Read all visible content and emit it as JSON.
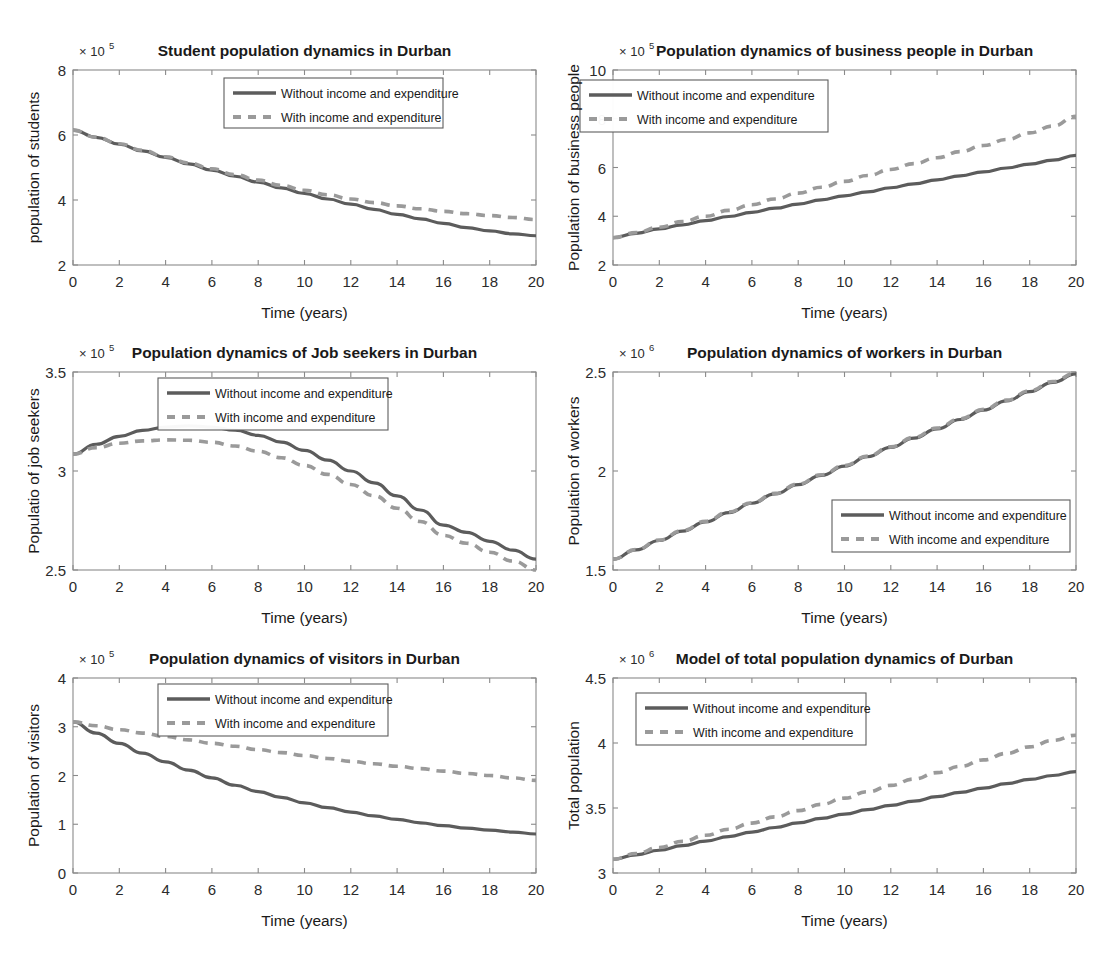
{
  "figure": {
    "layout": "2 columns x 3 rows of MATLAB line plots",
    "background": "#ffffff",
    "series_colors": {
      "without": "#5c5c5c",
      "with": "#9a9a9a"
    },
    "common_xlabel": "Time (years)",
    "legend_labels": [
      "Without income and expenditure",
      "With income and expenditure"
    ]
  },
  "chart_data": [
    {
      "id": "students",
      "type": "line",
      "title": "Student population dynamics in Durban",
      "xlabel": "Time (years)",
      "ylabel": "population of students",
      "yexponent": "× 10",
      "yexponent_sup": "5",
      "xlim": [
        0,
        20
      ],
      "ylim": [
        2,
        8
      ],
      "xticks": [
        0,
        2,
        4,
        6,
        8,
        10,
        12,
        14,
        16,
        18,
        20
      ],
      "yticks": [
        2,
        4,
        6,
        8
      ],
      "grid": false,
      "legend_position": "top-center",
      "x": [
        0,
        1,
        2,
        3,
        4,
        5,
        6,
        7,
        8,
        9,
        10,
        11,
        12,
        13,
        14,
        15,
        16,
        17,
        18,
        19,
        20
      ],
      "series": [
        {
          "name": "Without income and expenditure",
          "style": "solid",
          "color": "#5c5c5c",
          "values": [
            6.15,
            5.93,
            5.72,
            5.51,
            5.31,
            5.11,
            4.92,
            4.73,
            4.55,
            4.37,
            4.2,
            4.03,
            3.87,
            3.71,
            3.56,
            3.42,
            3.28,
            3.15,
            3.05,
            2.96,
            2.9
          ]
        },
        {
          "name": "With income and expenditure",
          "style": "dashed",
          "color": "#9a9a9a",
          "values": [
            6.15,
            5.93,
            5.73,
            5.53,
            5.33,
            5.14,
            4.96,
            4.78,
            4.61,
            4.45,
            4.3,
            4.16,
            4.03,
            3.92,
            3.82,
            3.73,
            3.65,
            3.58,
            3.52,
            3.46,
            3.4
          ]
        }
      ]
    },
    {
      "id": "business",
      "type": "line",
      "title": "Population dynamics of business people in Durban",
      "xlabel": "Time (years)",
      "ylabel": "Population of business people",
      "yexponent": "× 10",
      "yexponent_sup": "5",
      "xlim": [
        0,
        20
      ],
      "ylim": [
        2,
        10
      ],
      "xticks": [
        0,
        2,
        4,
        6,
        8,
        10,
        12,
        14,
        16,
        18,
        20
      ],
      "yticks": [
        2,
        4,
        6,
        8,
        10
      ],
      "grid": false,
      "legend_position": "top-left",
      "x": [
        0,
        1,
        2,
        3,
        4,
        5,
        6,
        7,
        8,
        9,
        10,
        11,
        12,
        13,
        14,
        15,
        16,
        17,
        18,
        19,
        20
      ],
      "series": [
        {
          "name": "Without income and expenditure",
          "style": "solid",
          "color": "#5c5c5c",
          "values": [
            3.12,
            3.3,
            3.48,
            3.65,
            3.82,
            3.99,
            4.16,
            4.33,
            4.5,
            4.67,
            4.84,
            5.0,
            5.17,
            5.33,
            5.49,
            5.66,
            5.82,
            5.98,
            6.14,
            6.3,
            6.5
          ]
        },
        {
          "name": "With income and expenditure",
          "style": "dashed",
          "color": "#9a9a9a",
          "values": [
            3.12,
            3.33,
            3.55,
            3.78,
            4.0,
            4.24,
            4.47,
            4.71,
            4.95,
            5.19,
            5.43,
            5.67,
            5.92,
            6.16,
            6.4,
            6.65,
            6.9,
            7.15,
            7.42,
            7.7,
            8.1
          ]
        }
      ]
    },
    {
      "id": "jobseekers",
      "type": "line",
      "title": "Population dynamics of Job seekers in Durban",
      "xlabel": "Time (years)",
      "ylabel": "Populatio of job seekers",
      "yexponent": "× 10",
      "yexponent_sup": "5",
      "xlim": [
        0,
        20
      ],
      "ylim": [
        2.5,
        3.5
      ],
      "xticks": [
        0,
        2,
        4,
        6,
        8,
        10,
        12,
        14,
        16,
        18,
        20
      ],
      "yticks": [
        2.5,
        3,
        3.5
      ],
      "ytick_labels": [
        "2.5",
        "3",
        "3.5"
      ],
      "grid": false,
      "legend_position": "top-right",
      "x": [
        0,
        1,
        2,
        3,
        4,
        5,
        6,
        7,
        8,
        9,
        10,
        11,
        12,
        13,
        14,
        15,
        16,
        17,
        18,
        19,
        20
      ],
      "series": [
        {
          "name": "Without income and expenditure",
          "style": "solid",
          "color": "#5c5c5c",
          "values": [
            3.085,
            3.135,
            3.175,
            3.205,
            3.222,
            3.228,
            3.222,
            3.206,
            3.18,
            3.146,
            3.104,
            3.055,
            3.0,
            2.94,
            2.874,
            2.803,
            2.727,
            2.69,
            2.645,
            2.6,
            2.555
          ]
        },
        {
          "name": "With income and expenditure",
          "style": "dashed",
          "color": "#9a9a9a",
          "values": [
            3.085,
            3.118,
            3.14,
            3.152,
            3.157,
            3.155,
            3.145,
            3.126,
            3.1,
            3.067,
            3.028,
            2.983,
            2.932,
            2.875,
            2.812,
            2.745,
            2.675,
            2.635,
            2.59,
            2.545,
            2.5
          ]
        }
      ]
    },
    {
      "id": "workers",
      "type": "line",
      "title": "Population dynamics of workers in Durban",
      "xlabel": "Time (years)",
      "ylabel": "Population of workers",
      "yexponent": "× 10",
      "yexponent_sup": "6",
      "xlim": [
        0,
        20
      ],
      "ylim": [
        1.5,
        2.5
      ],
      "xticks": [
        0,
        2,
        4,
        6,
        8,
        10,
        12,
        14,
        16,
        18,
        20
      ],
      "yticks": [
        1.5,
        2,
        2.5
      ],
      "ytick_labels": [
        "1.5",
        "2",
        "2.5"
      ],
      "grid": false,
      "legend_position": "lower-right",
      "x": [
        0,
        1,
        2,
        3,
        4,
        5,
        6,
        7,
        8,
        9,
        10,
        11,
        12,
        13,
        14,
        15,
        16,
        17,
        18,
        19,
        20
      ],
      "series": [
        {
          "name": "Without income and expenditure",
          "style": "solid",
          "color": "#5c5c5c",
          "values": [
            1.555,
            1.602,
            1.649,
            1.696,
            1.743,
            1.79,
            1.837,
            1.884,
            1.931,
            1.978,
            2.025,
            2.072,
            2.119,
            2.166,
            2.213,
            2.26,
            2.307,
            2.354,
            2.401,
            2.448,
            2.49
          ]
        },
        {
          "name": "With income and expenditure",
          "style": "dashed",
          "color": "#9a9a9a",
          "values": [
            1.555,
            1.603,
            1.651,
            1.699,
            1.746,
            1.793,
            1.84,
            1.887,
            1.934,
            1.981,
            2.028,
            2.075,
            2.122,
            2.17,
            2.217,
            2.264,
            2.311,
            2.358,
            2.405,
            2.452,
            2.495
          ]
        }
      ]
    },
    {
      "id": "visitors",
      "type": "line",
      "title": "Population dynamics of visitors in Durban",
      "xlabel": "Time (years)",
      "ylabel": "Population of visitors",
      "yexponent": "× 10",
      "yexponent_sup": "5",
      "xlim": [
        0,
        20
      ],
      "ylim": [
        0,
        4
      ],
      "xticks": [
        0,
        2,
        4,
        6,
        8,
        10,
        12,
        14,
        16,
        18,
        20
      ],
      "yticks": [
        0,
        1,
        2,
        3,
        4
      ],
      "grid": false,
      "legend_position": "top-right",
      "x": [
        0,
        1,
        2,
        3,
        4,
        5,
        6,
        7,
        8,
        9,
        10,
        11,
        12,
        13,
        14,
        15,
        16,
        17,
        18,
        19,
        20
      ],
      "series": [
        {
          "name": "Without income and expenditure",
          "style": "solid",
          "color": "#5c5c5c",
          "values": [
            3.1,
            2.87,
            2.66,
            2.46,
            2.28,
            2.11,
            1.95,
            1.8,
            1.67,
            1.55,
            1.44,
            1.34,
            1.25,
            1.17,
            1.1,
            1.03,
            0.97,
            0.92,
            0.88,
            0.84,
            0.8
          ]
        },
        {
          "name": "With income and expenditure",
          "style": "dashed",
          "color": "#9a9a9a",
          "values": [
            3.1,
            3.02,
            2.94,
            2.87,
            2.8,
            2.73,
            2.66,
            2.6,
            2.53,
            2.47,
            2.41,
            2.35,
            2.29,
            2.24,
            2.19,
            2.14,
            2.09,
            2.04,
            2.0,
            1.95,
            1.9
          ]
        }
      ]
    },
    {
      "id": "total",
      "type": "line",
      "title": "Model of total population dynamics of Durban",
      "xlabel": "Time (years)",
      "ylabel": "Total population",
      "yexponent": "× 10",
      "yexponent_sup": "6",
      "xlim": [
        0,
        20
      ],
      "ylim": [
        3,
        4.5
      ],
      "xticks": [
        0,
        2,
        4,
        6,
        8,
        10,
        12,
        14,
        16,
        18,
        20
      ],
      "yticks": [
        3,
        3.5,
        4,
        4.5
      ],
      "ytick_labels": [
        "3",
        "3.5",
        "4",
        "4.5"
      ],
      "grid": false,
      "legend_position": "top-left",
      "x": [
        0,
        1,
        2,
        3,
        4,
        5,
        6,
        7,
        8,
        9,
        10,
        11,
        12,
        13,
        14,
        15,
        16,
        17,
        18,
        19,
        20
      ],
      "series": [
        {
          "name": "Without income and expenditure",
          "style": "solid",
          "color": "#5c5c5c",
          "values": [
            3.105,
            3.14,
            3.175,
            3.21,
            3.245,
            3.28,
            3.315,
            3.35,
            3.385,
            3.42,
            3.453,
            3.487,
            3.52,
            3.553,
            3.587,
            3.62,
            3.653,
            3.687,
            3.72,
            3.75,
            3.78
          ]
        },
        {
          "name": "With income and expenditure",
          "style": "dashed",
          "color": "#9a9a9a",
          "values": [
            3.105,
            3.15,
            3.196,
            3.243,
            3.29,
            3.337,
            3.384,
            3.432,
            3.48,
            3.528,
            3.576,
            3.625,
            3.674,
            3.723,
            3.772,
            3.82,
            3.87,
            3.92,
            3.97,
            4.02,
            4.06
          ]
        }
      ]
    }
  ]
}
